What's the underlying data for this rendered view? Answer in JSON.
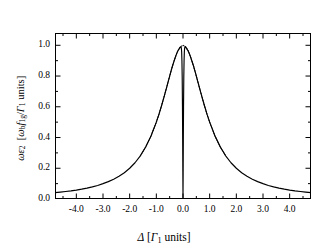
{
  "chart_data": {
    "type": "line",
    "title": "",
    "xlabel": "Δ [Γ₁ units]",
    "ylabel": "ωε₂ [ωᵇf₁g/Γ₁ units]",
    "xlim": [
      -4.8,
      4.8
    ],
    "ylim": [
      0.0,
      1.08
    ],
    "grid": false,
    "legend": null,
    "xticks": [
      -4.0,
      -3.0,
      -2.0,
      -1.0,
      0.0,
      1.0,
      2.0,
      3.0,
      4.0
    ],
    "xticklabels": [
      "-4.0",
      "-3.0",
      "-2.0",
      "-1.0",
      "0.0",
      "1.0",
      "2.0",
      "3.0",
      "4.0"
    ],
    "yticks": [
      0.0,
      0.2,
      0.4,
      0.6,
      0.8,
      1.0
    ],
    "yticklabels": [
      "0.0",
      "0.2",
      "0.4",
      "0.6",
      "0.8",
      "1.0"
    ],
    "xminorticks": [
      -4.5,
      -3.5,
      -2.5,
      -1.5,
      -0.5,
      0.5,
      1.5,
      2.5,
      3.5,
      4.5
    ],
    "yminorticks": [
      0.1,
      0.3,
      0.5,
      0.7,
      0.9
    ],
    "series": [
      {
        "name": "with spectral hole",
        "style": "solid",
        "color": "#000000",
        "x": [
          -4.8,
          -4.6,
          -4.4,
          -4.2,
          -4.0,
          -3.8,
          -3.6,
          -3.4,
          -3.2,
          -3.0,
          -2.8,
          -2.6,
          -2.4,
          -2.2,
          -2.0,
          -1.8,
          -1.6,
          -1.4,
          -1.2,
          -1.0,
          -0.9,
          -0.8,
          -0.7,
          -0.6,
          -0.5,
          -0.45,
          -0.4,
          -0.35,
          -0.3,
          -0.26,
          -0.22,
          -0.19,
          -0.16,
          -0.14,
          -0.12,
          -0.1,
          -0.085,
          -0.07,
          -0.06,
          -0.05,
          -0.04,
          -0.03,
          -0.02,
          -0.012,
          -0.006,
          0.0,
          0.006,
          0.012,
          0.02,
          0.03,
          0.04,
          0.05,
          0.06,
          0.07,
          0.085,
          0.1,
          0.12,
          0.14,
          0.16,
          0.19,
          0.22,
          0.26,
          0.3,
          0.35,
          0.4,
          0.45,
          0.5,
          0.6,
          0.7,
          0.8,
          0.9,
          1.0,
          1.2,
          1.4,
          1.6,
          1.8,
          2.0,
          2.2,
          2.4,
          2.6,
          2.8,
          3.0,
          3.2,
          3.4,
          3.6,
          3.8,
          4.0,
          4.2,
          4.4,
          4.6,
          4.8
        ],
        "y": [
          0.041,
          0.045,
          0.049,
          0.053,
          0.058,
          0.064,
          0.071,
          0.079,
          0.088,
          0.1,
          0.113,
          0.129,
          0.148,
          0.171,
          0.2,
          0.236,
          0.281,
          0.338,
          0.41,
          0.5,
          0.552,
          0.61,
          0.671,
          0.735,
          0.8,
          0.832,
          0.862,
          0.89,
          0.916,
          0.936,
          0.953,
          0.964,
          0.973,
          0.978,
          0.983,
          0.988,
          0.99,
          0.988,
          0.979,
          0.955,
          0.9,
          0.79,
          0.6,
          0.38,
          0.17,
          0.01,
          0.17,
          0.38,
          0.6,
          0.79,
          0.9,
          0.955,
          0.979,
          0.988,
          0.99,
          0.988,
          0.983,
          0.978,
          0.973,
          0.964,
          0.953,
          0.936,
          0.916,
          0.89,
          0.862,
          0.832,
          0.8,
          0.735,
          0.671,
          0.61,
          0.552,
          0.5,
          0.41,
          0.338,
          0.281,
          0.236,
          0.2,
          0.171,
          0.148,
          0.129,
          0.113,
          0.1,
          0.088,
          0.079,
          0.071,
          0.064,
          0.058,
          0.053,
          0.049,
          0.045,
          0.041
        ]
      },
      {
        "name": "unperturbed Lorentzian",
        "style": "dotted",
        "color": "#000000",
        "x": [
          -1.6,
          -1.4,
          -1.2,
          -1.0,
          -0.9,
          -0.8,
          -0.7,
          -0.6,
          -0.5,
          -0.4,
          -0.3,
          -0.2,
          -0.1,
          0.0,
          0.1,
          0.2,
          0.3,
          0.4,
          0.5,
          0.6,
          0.7,
          0.8,
          0.9,
          1.0,
          1.2,
          1.4,
          1.6
        ],
        "y": [
          0.281,
          0.338,
          0.41,
          0.5,
          0.552,
          0.61,
          0.671,
          0.735,
          0.8,
          0.862,
          0.916,
          0.962,
          0.99,
          1.0,
          0.99,
          0.962,
          0.916,
          0.862,
          0.8,
          0.735,
          0.671,
          0.61,
          0.552,
          0.5,
          0.41,
          0.338,
          0.281
        ]
      }
    ]
  }
}
